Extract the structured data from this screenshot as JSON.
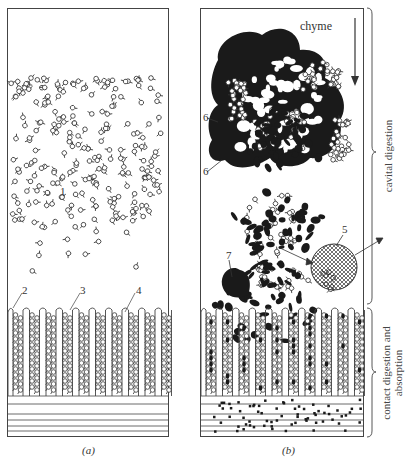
{
  "figure": {
    "panels": [
      {
        "id": "a",
        "caption": "(a)",
        "labels": [
          {
            "text": "1",
            "x": 60,
            "y": 186
          },
          {
            "text": "2",
            "x": 22,
            "y": 285
          },
          {
            "text": "3",
            "x": 80,
            "y": 285
          },
          {
            "text": "4",
            "x": 136,
            "y": 285
          }
        ]
      },
      {
        "id": "b",
        "caption": "(b)",
        "title": "chyme",
        "labels": [
          {
            "text": "5",
            "x": 342,
            "y": 229
          },
          {
            "text": "6",
            "x": 203,
            "y": 112
          },
          {
            "text": "6",
            "x": 203,
            "y": 170
          },
          {
            "text": "7",
            "x": 226,
            "y": 252
          }
        ]
      }
    ],
    "zones": [
      {
        "name": "cavital-digestion",
        "text": "cavital digestion"
      },
      {
        "name": "contact-digestion",
        "line1": "contact digestion and",
        "line2": "absorption"
      }
    ],
    "colors": {
      "ink": "#2a2a2a",
      "paper": "#ffffff"
    }
  }
}
